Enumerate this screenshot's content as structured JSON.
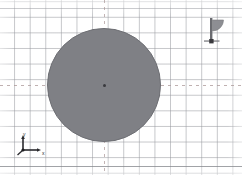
{
  "viewport": {
    "name": "cad-sketch-viewport",
    "width": 242,
    "height": 175,
    "background_color": "#ffffff"
  },
  "grid": {
    "name": "background-grid",
    "visible": true,
    "spacing_px": 15.6,
    "line_color": "#96989e",
    "minor_visible": false
  },
  "construction_lines": {
    "horizontal": {
      "label": "horizontal-center-line",
      "style": "dashed",
      "y": 85,
      "color": "#aa9696"
    },
    "vertical": {
      "label": "vertical-center-line",
      "style": "dashed",
      "x": 104,
      "color": "#aa9696"
    }
  },
  "shapes": [
    {
      "name": "filled-circle",
      "type": "circle",
      "center_x": 104,
      "center_y": 85,
      "radius": 57,
      "diameter": 114,
      "fill_color": "#7f8085",
      "stroke_color": "#6e6f74",
      "filled": true,
      "selected": false
    }
  ],
  "center_marker": {
    "name": "circle-center-point",
    "x": 104,
    "y": 85,
    "color": "#3a3a3e"
  },
  "axis_triad": {
    "name": "origin-axis-indicator",
    "x_label": "x",
    "y_label": "y",
    "color": "#2a2a2e",
    "origin_x": 22,
    "origin_y": 149
  },
  "sector_glyph": {
    "name": "sector-angle-marker",
    "type": "quarter-sector-flag",
    "fill_color": "#8d8e93",
    "pole_color": "#6a6b70",
    "base_color": "#3a3a3e",
    "x": 217,
    "y": 33
  }
}
